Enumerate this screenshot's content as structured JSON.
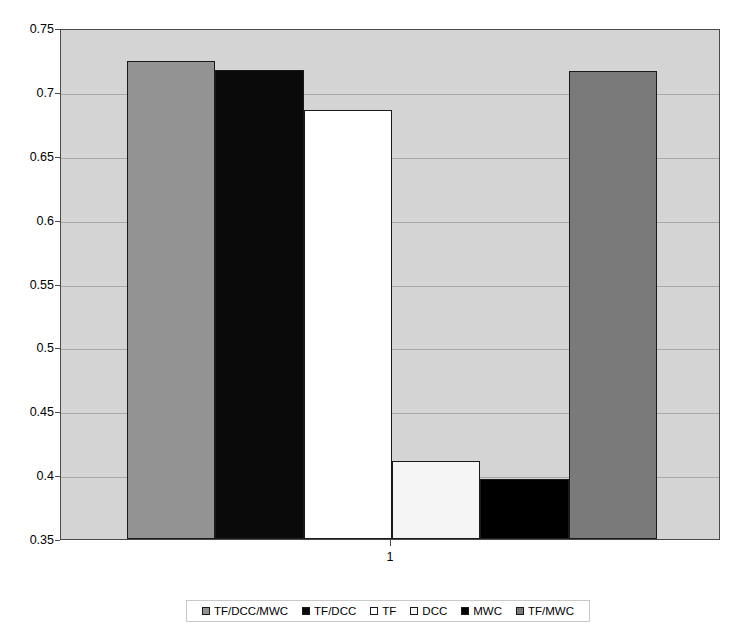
{
  "chart_data": {
    "type": "bar",
    "title": "",
    "subtitle": "",
    "xlabel": "",
    "ylabel": "",
    "categories": [
      "1"
    ],
    "xtick_labels": [
      "1"
    ],
    "ylim": [
      0.35,
      0.75
    ],
    "ytick_labels": [
      "0.75",
      "0.7",
      "0.65",
      "0.6",
      "0.55",
      "0.5",
      "0.45",
      "0.4",
      "0.35"
    ],
    "ytick_values": [
      0.75,
      0.7,
      0.65,
      0.6,
      0.55,
      0.5,
      0.45,
      0.4,
      0.35
    ],
    "grid": true,
    "legend_position": "bottom",
    "plot_background": "#d4d4d4",
    "series": [
      {
        "name": "TF/DCC/MWC",
        "values": [
          0.724
        ],
        "color": "#939393"
      },
      {
        "name": "TF/DCC",
        "values": [
          0.717
        ],
        "color": "#0a0a0a"
      },
      {
        "name": "TF",
        "values": [
          0.686
        ],
        "color": "#ffffff"
      },
      {
        "name": "DCC",
        "values": [
          0.411
        ],
        "color": "#f5f5f5"
      },
      {
        "name": "MWC",
        "values": [
          0.397
        ],
        "color": "#000000"
      },
      {
        "name": "TF/MWC",
        "values": [
          0.716
        ],
        "color": "#7a7a7a"
      }
    ]
  },
  "legend": {
    "items": [
      {
        "label": "TF/DCC/MWC",
        "color": "#939393"
      },
      {
        "label": "TF/DCC",
        "color": "#0a0a0a"
      },
      {
        "label": "TF",
        "color": "#ffffff"
      },
      {
        "label": "DCC",
        "color": "#f5f5f5"
      },
      {
        "label": "MWC",
        "color": "#000000"
      },
      {
        "label": "TF/MWC",
        "color": "#7a7a7a"
      }
    ]
  }
}
